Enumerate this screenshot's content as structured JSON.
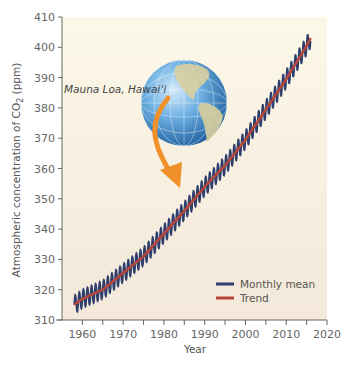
{
  "chart_data": {
    "type": "line",
    "title": "",
    "xlabel": "Year",
    "ylabel": "Atmospheric concentration of CO2 (ppm)",
    "ylabel_parts": {
      "pre": "Atmospheric concentration of CO",
      "sub": "2",
      "post": " (ppm)"
    },
    "xlim": [
      1955,
      2020
    ],
    "ylim": [
      310,
      410
    ],
    "x_ticks": [
      1960,
      1970,
      1980,
      1990,
      2000,
      2010,
      2020
    ],
    "x_minor_ticks": [
      1965,
      1975,
      1985,
      1995,
      2005,
      2015
    ],
    "y_ticks": [
      310,
      320,
      330,
      340,
      350,
      360,
      370,
      380,
      390,
      400,
      410
    ],
    "grid": false,
    "legend_position": "lower right",
    "annotation": "Mauna Loa, Hawai‘i",
    "series": [
      {
        "name": "Monthly mean",
        "color": "#2e3f6e",
        "seasonal_amplitude_ppm": 3,
        "x": [
          1958,
          1960,
          1965,
          1970,
          1975,
          1980,
          1985,
          1990,
          1995,
          2000,
          2005,
          2010,
          2015,
          2016
        ],
        "values": [
          315,
          317,
          320,
          325.5,
          331,
          338.5,
          346,
          354,
          361,
          369.5,
          379.5,
          389.5,
          400.5,
          403
        ]
      },
      {
        "name": "Trend",
        "color": "#b8453a",
        "x": [
          1958,
          1960,
          1965,
          1970,
          1975,
          1980,
          1985,
          1990,
          1995,
          2000,
          2005,
          2010,
          2015,
          2016
        ],
        "values": [
          315,
          317,
          320,
          325.5,
          331,
          338.5,
          346,
          354,
          361,
          369.5,
          379.5,
          389.5,
          400.5,
          403
        ]
      }
    ]
  },
  "colors": {
    "plot_bg_top": "#fcf8e8",
    "plot_bg_bottom": "#f3e8da",
    "axis": "#555555",
    "arrow": "#f0902a",
    "globe_ocean": "#3f8fd0",
    "globe_land": "#d9cf9f"
  }
}
